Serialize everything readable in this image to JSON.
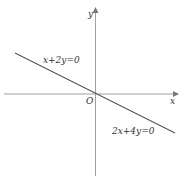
{
  "diagram": {
    "axes": {
      "x_label": "x",
      "y_label": "y",
      "origin_label": "O"
    },
    "lines": [
      {
        "label": "x+2y=0",
        "equation": "x+2y=0"
      },
      {
        "label": "2x+4y=0",
        "equation": "2x+4y=0"
      }
    ],
    "caption": "",
    "colors": {
      "axis": "#9a9a9a",
      "line": "#555555",
      "text": "#333333"
    }
  }
}
